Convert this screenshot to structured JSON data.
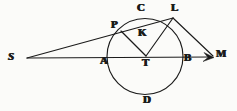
{
  "figure": {
    "stroke_color": "#1b1b1b",
    "background_color": "#fbfbf9",
    "width": 237,
    "height": 111
  },
  "labels": [
    {
      "id": "S",
      "text": "S",
      "x": 8,
      "y": 51,
      "style": "italic"
    },
    {
      "id": "P",
      "text": "P",
      "x": 111,
      "y": 19,
      "style": "bold"
    },
    {
      "id": "C",
      "text": "C",
      "x": 137,
      "y": 2,
      "style": "bold"
    },
    {
      "id": "L",
      "text": "L",
      "x": 171,
      "y": 2,
      "style": "bold"
    },
    {
      "id": "K",
      "text": "K",
      "x": 138,
      "y": 27,
      "style": "bold"
    },
    {
      "id": "A",
      "text": "A",
      "x": 100,
      "y": 55,
      "style": "bold"
    },
    {
      "id": "T",
      "text": "T",
      "x": 142,
      "y": 57,
      "style": "bold"
    },
    {
      "id": "B",
      "text": "B",
      "x": 184,
      "y": 52,
      "style": "bold"
    },
    {
      "id": "M",
      "text": "M",
      "x": 216,
      "y": 48,
      "style": "bold"
    },
    {
      "id": "D",
      "text": "D",
      "x": 143,
      "y": 94,
      "style": "bold"
    }
  ],
  "geometry": {
    "circle": {
      "cx": 145,
      "cy": 56.5,
      "r": 38
    },
    "points": {
      "S": {
        "x": 27,
        "y": 58
      },
      "P": {
        "x": 121,
        "y": 31
      },
      "C": {
        "x": 143,
        "y": 19
      },
      "L": {
        "x": 173,
        "y": 18
      },
      "K": {
        "x": 147,
        "y": 33
      },
      "A": {
        "x": 107,
        "y": 58
      },
      "T": {
        "x": 146,
        "y": 56
      },
      "B": {
        "x": 183,
        "y": 58
      },
      "M": {
        "x": 214,
        "y": 57
      },
      "D": {
        "x": 146,
        "y": 94
      }
    },
    "segments": [
      {
        "name": "secant-S-P-L",
        "from": "S",
        "to": "L"
      },
      {
        "name": "diameter-S-A-T-B-M",
        "from": "S",
        "to": "M"
      },
      {
        "name": "radius-T-P",
        "from": "T",
        "to": "P"
      },
      {
        "name": "radius-T-L",
        "from": "T",
        "to": "L"
      },
      {
        "name": "tangent-L-M",
        "from": "L",
        "to": "M"
      }
    ],
    "arrow_at": "M"
  }
}
